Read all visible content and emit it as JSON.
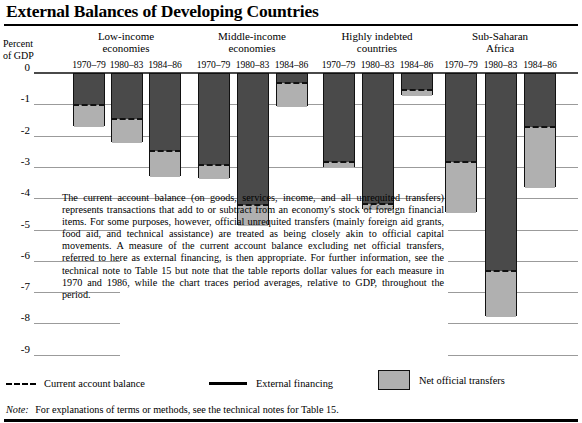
{
  "title": "External Balances of Developing Countries",
  "axis": {
    "caption_line1": "Percent",
    "caption_line2": "of GDP",
    "ticks": [
      "0",
      "-1",
      "-2",
      "-3",
      "-4",
      "-5",
      "-6",
      "-7",
      "-8",
      "-9"
    ]
  },
  "groups": [
    {
      "name_line1": "Low-income",
      "name_line2": "economies"
    },
    {
      "name_line1": "Middle-income",
      "name_line2": "economies"
    },
    {
      "name_line1": "Highly indebted",
      "name_line2": "countries"
    },
    {
      "name_line1": "Sub-Saharan",
      "name_line2": "Africa"
    }
  ],
  "periods": [
    "1970–79",
    "1980–83",
    "1984–86"
  ],
  "bodytext": "The current account balance (on goods, services, income, and all unrequited transfers) represents transactions that add to or subtract from an economy's stock of foreign financial items. For some purposes, however, official unrequited transfers (mainly foreign aid grants, food aid, and technical assistance) are treated as being closely akin to official capital movements. A measure of the current account balance excluding net official transfers, referred to here as external financing, is then appropriate. For further information, see the technical note to Table 15 but note that the table reports dollar values for each measure in 1970 and 1986, while the chart traces period averages, relative to GDP, throughout the period.",
  "legend": {
    "current_account_balance": "Current account balance",
    "external_financing": "External financing",
    "net_official_transfers": "Net official transfers"
  },
  "note_label": "Note:",
  "note_text": "For explanations of terms or methods, see the technical notes for Table 15.",
  "colors": {
    "external_financing_fill": "#4a4a4a",
    "net_official_transfers_fill": "#b0b0b0",
    "outline": "#111111",
    "gridline": "#9b9b9b",
    "zeroline": "#4a4a4a",
    "background": "#ffffff"
  },
  "chart_data": {
    "type": "bar",
    "title": "External Balances of Developing Countries",
    "xlabel": "",
    "ylabel": "Percent of GDP",
    "ylim": [
      -9,
      0
    ],
    "grid": true,
    "legend_position": "bottom",
    "note": "Each bar spans from 0 to external financing (total bar bottom). The dashed line marks the current account balance; the light shaded segment between the dashed line and the bar bottom is net official transfers.",
    "categories": [
      "1970–79",
      "1980–83",
      "1984–86"
    ],
    "series": [
      {
        "name": "Low-income economies",
        "current_account_balance": [
          -1.0,
          -1.45,
          -2.45
        ],
        "external_financing": [
          -1.7,
          -2.2,
          -3.3
        ],
        "net_official_transfers": [
          0.7,
          0.75,
          0.85
        ]
      },
      {
        "name": "Middle-income economies",
        "current_account_balance": [
          -2.9,
          -4.2,
          -0.3
        ],
        "external_financing": [
          -3.35,
          -4.85,
          -1.05
        ],
        "net_official_transfers": [
          0.45,
          0.65,
          0.75
        ]
      },
      {
        "name": "Highly indebted countries",
        "current_account_balance": [
          -2.8,
          -4.15,
          -0.5
        ],
        "external_financing": [
          -3.0,
          -4.35,
          -0.7
        ],
        "net_official_transfers": [
          0.2,
          0.2,
          0.2
        ]
      },
      {
        "name": "Sub-Saharan Africa",
        "current_account_balance": [
          -2.8,
          -6.3,
          -1.7
        ],
        "external_financing": [
          -4.45,
          -7.75,
          -3.65
        ],
        "net_official_transfers": [
          1.65,
          1.45,
          1.95
        ]
      }
    ]
  }
}
